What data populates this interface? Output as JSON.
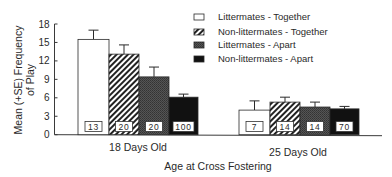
{
  "chart_data": {
    "type": "bar",
    "title": "",
    "xlabel": "Age at Cross Fostering",
    "ylabel": "Mean (+SE) Frequency of Play",
    "ylabel_lines": [
      "Mean (+SE) Frequency",
      "of Play"
    ],
    "ylim": [
      0,
      18
    ],
    "yticks": [
      0,
      3,
      6,
      9,
      12,
      15,
      18
    ],
    "grid": false,
    "legend_position": "upper right",
    "categories": [
      "18 Days Old",
      "25 Days Old"
    ],
    "series": [
      {
        "name": "Littermates - Together",
        "pattern": "white",
        "values": [
          15.5,
          4.0
        ],
        "se_top": [
          17.0,
          5.5
        ],
        "n": [
          "13",
          "7"
        ]
      },
      {
        "name": "Non-littermates - Together",
        "pattern": "hatch",
        "values": [
          13.1,
          5.3
        ],
        "se_top": [
          14.6,
          6.1
        ],
        "n": [
          "20",
          "14"
        ]
      },
      {
        "name": "Littermates - Apart",
        "pattern": "darkgray",
        "values": [
          9.4,
          4.5
        ],
        "se_top": [
          11.0,
          5.3
        ],
        "n": [
          "20",
          "14"
        ]
      },
      {
        "name": "Non-littermates - Apart",
        "pattern": "black",
        "values": [
          6.1,
          4.2
        ],
        "se_top": [
          6.6,
          4.6
        ],
        "n": [
          "100",
          "70"
        ]
      }
    ]
  },
  "colors": {
    "axis": "#3a3a3a",
    "bar_outline": "#2a2a2a",
    "white_fill": "#ffffff",
    "dark_fill": "#4a4a4a",
    "black_fill": "#111111"
  }
}
